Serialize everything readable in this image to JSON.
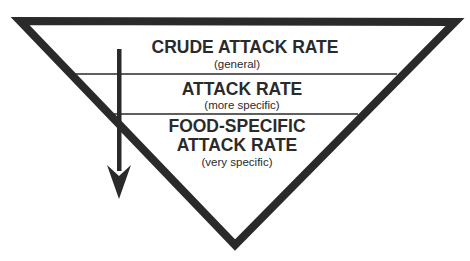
{
  "diagram": {
    "type": "inverted-triangle-hierarchy",
    "colors": {
      "stroke": "#2a2a2a",
      "fill": "#ffffff",
      "text": "#2a2a2a"
    },
    "levels": [
      {
        "title_lines": [
          "CRUDE ATTACK RATE"
        ],
        "subtitle": "(general)"
      },
      {
        "title_lines": [
          "ATTACK RATE"
        ],
        "subtitle": "(more specific)"
      },
      {
        "title_lines": [
          "FOOD-SPECIFIC",
          "ATTACK RATE"
        ],
        "subtitle": "(very specific)"
      }
    ],
    "arrow": {
      "direction": "down",
      "meaning": "increasing specificity"
    }
  }
}
